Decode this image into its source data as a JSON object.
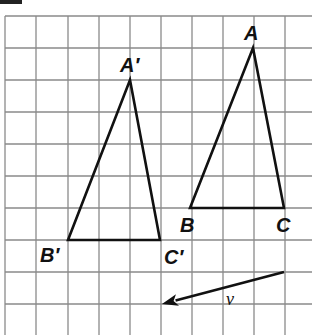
{
  "figure": {
    "problem_label_fragment": "",
    "grid": {
      "x_lines": [
        5,
        36,
        68,
        99,
        130,
        161,
        192,
        223,
        254,
        285
      ],
      "y_lines": [
        16,
        48,
        80,
        112,
        144,
        176,
        208,
        240,
        272,
        304
      ],
      "x_extent": [
        5,
        312
      ],
      "y_extent": [
        16,
        335
      ],
      "color": "#8a8a8a"
    },
    "triangle_original": {
      "vertices": {
        "A": {
          "label": "A",
          "x": 253,
          "y": 48
        },
        "B": {
          "label": "B",
          "x": 190,
          "y": 208
        },
        "C": {
          "label": "C",
          "x": 284,
          "y": 208
        }
      }
    },
    "triangle_image": {
      "vertices": {
        "A_prime": {
          "label": "A′",
          "x": 130,
          "y": 80
        },
        "B_prime": {
          "label": "B′",
          "x": 68,
          "y": 240
        },
        "C_prime": {
          "label": "C′",
          "x": 160,
          "y": 240
        }
      }
    },
    "vector": {
      "label": "v⃗",
      "from": {
        "x": 284,
        "y": 272
      },
      "to": {
        "x": 162,
        "y": 304
      }
    },
    "line_color": "#111111"
  }
}
